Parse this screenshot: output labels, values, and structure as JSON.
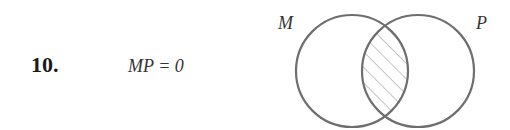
{
  "problem": {
    "number": "10.",
    "expression": "MP = 0"
  },
  "venn": {
    "sets": [
      {
        "label": "M",
        "cx": 352,
        "cy": 71,
        "r": 56
      },
      {
        "label": "P",
        "cx": 418,
        "cy": 71,
        "r": 56
      }
    ],
    "shaded_region": "intersection",
    "hatch": "diagonal",
    "stroke_color": "#6e6e6e",
    "hatch_color": "#8a8a8a"
  }
}
